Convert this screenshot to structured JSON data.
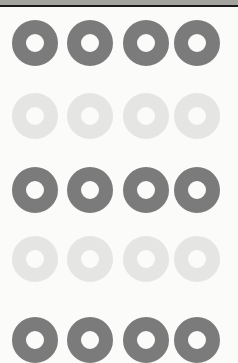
{
  "colors": {
    "background": "#fbfbfa",
    "top_band": "#a3a3a0",
    "top_line": "#1c1c1c",
    "dark_ring": "#7b7b7b",
    "light_ring": "#e5e5e3"
  },
  "layout": {
    "columns_x_center": [
      35,
      90,
      146,
      197
    ],
    "rows": [
      {
        "y_center": 43,
        "tone": "dark"
      },
      {
        "y_center": 116,
        "tone": "light"
      },
      {
        "y_center": 190,
        "tone": "dark"
      },
      {
        "y_center": 259,
        "tone": "light"
      },
      {
        "y_center": 340,
        "tone": "dark"
      }
    ],
    "ring_outer_diameter": 46,
    "ring_inner_diameter": 18
  },
  "icons": {
    "ring": "donut-shape"
  }
}
